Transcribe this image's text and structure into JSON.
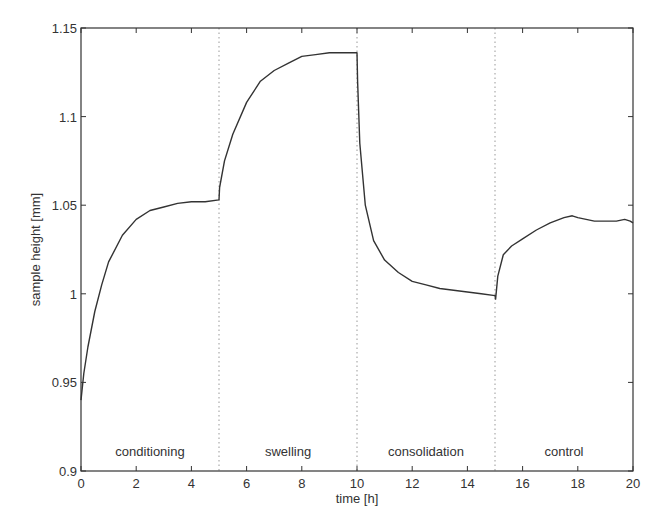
{
  "chart_data": {
    "type": "line",
    "title": "",
    "xlabel": "time [h]",
    "ylabel": "sample height [mm]",
    "xlim": [
      0,
      20
    ],
    "ylim": [
      0.9,
      1.15
    ],
    "xticks": [
      0,
      2,
      4,
      6,
      8,
      10,
      12,
      14,
      16,
      18,
      20
    ],
    "yticks": [
      0.9,
      0.95,
      1,
      1.05,
      1.1,
      1.15
    ],
    "xtick_labels": [
      "0",
      "2",
      "4",
      "6",
      "8",
      "10",
      "12",
      "14",
      "16",
      "18",
      "20"
    ],
    "ytick_labels": [
      "0.9",
      "0.95",
      "1",
      "1.05",
      "1.1",
      "1.15"
    ],
    "grid": false,
    "legend": null,
    "phase_boundaries": [
      5,
      10,
      15
    ],
    "phases": [
      {
        "label": "conditioning",
        "start": 0,
        "end": 5
      },
      {
        "label": "swelling",
        "start": 5,
        "end": 10
      },
      {
        "label": "consolidation",
        "start": 10,
        "end": 15
      },
      {
        "label": "control",
        "start": 15,
        "end": 20
      }
    ],
    "series": [
      {
        "name": "sample height",
        "x": [
          0,
          0.1,
          0.25,
          0.5,
          0.75,
          1,
          1.5,
          2,
          2.5,
          3,
          3.5,
          4,
          4.5,
          5,
          5.02,
          5.2,
          5.5,
          6,
          6.5,
          7,
          7.5,
          8,
          8.5,
          9,
          9.5,
          10,
          10.02,
          10.1,
          10.3,
          10.6,
          11,
          11.5,
          12,
          12.5,
          13,
          13.5,
          14,
          14.5,
          15,
          15.02,
          15.1,
          15.3,
          15.6,
          16,
          16.5,
          17,
          17.5,
          17.8,
          18,
          18.3,
          18.6,
          19,
          19.4,
          19.7,
          19.9,
          20
        ],
        "y": [
          0.94,
          0.955,
          0.97,
          0.99,
          1.005,
          1.018,
          1.033,
          1.042,
          1.047,
          1.049,
          1.051,
          1.052,
          1.052,
          1.053,
          1.06,
          1.075,
          1.09,
          1.108,
          1.12,
          1.126,
          1.13,
          1.134,
          1.135,
          1.136,
          1.136,
          1.136,
          1.12,
          1.085,
          1.05,
          1.03,
          1.019,
          1.012,
          1.007,
          1.005,
          1.003,
          1.002,
          1.001,
          1.0,
          0.999,
          0.997,
          1.01,
          1.022,
          1.027,
          1.031,
          1.036,
          1.04,
          1.043,
          1.044,
          1.043,
          1.042,
          1.041,
          1.041,
          1.041,
          1.042,
          1.041,
          1.04
        ]
      }
    ]
  }
}
